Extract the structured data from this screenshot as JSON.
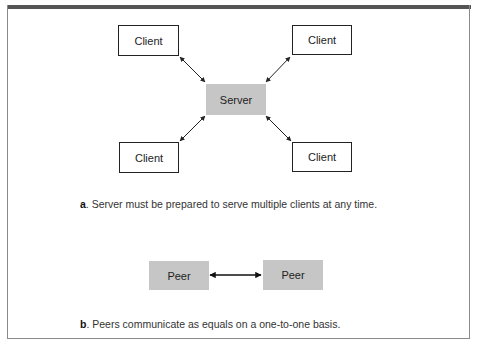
{
  "diagram": {
    "part_a": {
      "nodes": [
        {
          "id": "client-tl",
          "label": "Client",
          "type": "client"
        },
        {
          "id": "client-tr",
          "label": "Client",
          "type": "client"
        },
        {
          "id": "server",
          "label": "Server",
          "type": "server"
        },
        {
          "id": "client-bl",
          "label": "Client",
          "type": "client"
        },
        {
          "id": "client-br",
          "label": "Client",
          "type": "client"
        }
      ],
      "edges": [
        {
          "from": "client-tl",
          "to": "server",
          "style": "bidirectional"
        },
        {
          "from": "client-tr",
          "to": "server",
          "style": "bidirectional"
        },
        {
          "from": "client-bl",
          "to": "server",
          "style": "bidirectional"
        },
        {
          "from": "client-br",
          "to": "server",
          "style": "bidirectional"
        }
      ],
      "caption_label": "a",
      "caption_text": ". Server must be prepared to serve multiple clients at any time."
    },
    "part_b": {
      "nodes": [
        {
          "id": "peer-left",
          "label": "Peer",
          "type": "peer"
        },
        {
          "id": "peer-right",
          "label": "Peer",
          "type": "peer"
        }
      ],
      "edges": [
        {
          "from": "peer-left",
          "to": "peer-right",
          "style": "bidirectional"
        }
      ],
      "caption_label": "b",
      "caption_text": ". Peers communicate as equals on a one-to-one basis."
    },
    "colors": {
      "client_fill": "#ffffff",
      "server_fill": "#c6c6c6",
      "peer_fill": "#c6c6c6",
      "border": "#222222",
      "frame_top": "#555555"
    }
  }
}
